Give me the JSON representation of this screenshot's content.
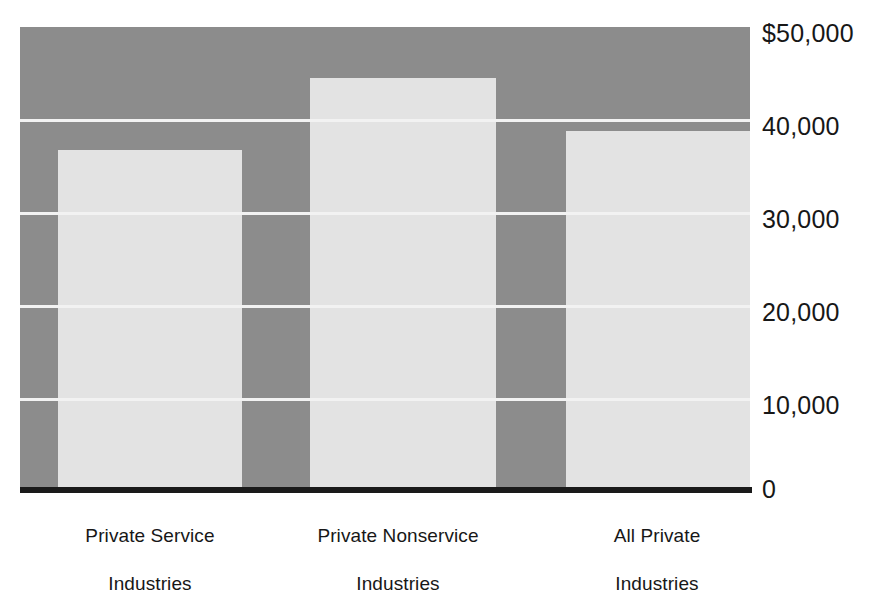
{
  "chart_data": {
    "type": "bar",
    "title": "",
    "subtitle": "",
    "xlabel": "",
    "ylabel": "",
    "categories": [
      "Private Service Industries",
      "Private Nonservice Industries",
      "All Private Industries"
    ],
    "values": [
      36800,
      44500,
      38800
    ],
    "ylim": [
      0,
      50000
    ],
    "yticks": [
      0,
      10000,
      20000,
      30000,
      40000,
      50000
    ],
    "ytick_labels": [
      "0",
      "10,000",
      "20,000",
      "30,000",
      "40,000",
      "$50,000"
    ],
    "grid": true,
    "legend": null,
    "annotations": []
  },
  "axes": {
    "y_ticks": [
      {
        "label": "$50,000",
        "value": 50000
      },
      {
        "label": "40,000",
        "value": 40000
      },
      {
        "label": "30,000",
        "value": 30000
      },
      {
        "label": "20,000",
        "value": 20000
      },
      {
        "label": "10,000",
        "value": 10000
      },
      {
        "label": "0",
        "value": 0
      }
    ]
  },
  "categories": [
    {
      "line1": "Private Service",
      "line2": "Industries",
      "full": "Private Service Industries"
    },
    {
      "line1": "Private Nonservice",
      "line2": "Industries",
      "full": "Private Nonservice Industries"
    },
    {
      "line1": "All Private",
      "line2": "Industries",
      "full": "All Private Industries"
    }
  ],
  "colors": {
    "plot_background": "#8c8c8c",
    "bar_fill": "#e3e3e3",
    "gridline": "#f2f2f2",
    "axis": "#1a1a1a",
    "text": "#171717",
    "page_background": "#ffffff"
  }
}
